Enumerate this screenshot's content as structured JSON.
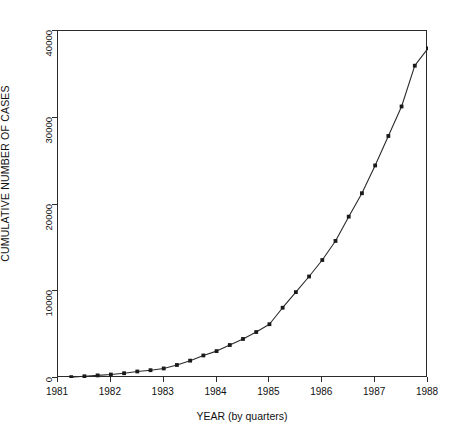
{
  "figure": {
    "background": "#ffffff",
    "ink": "#2b2b2b"
  },
  "axis_titles": {
    "x": "YEAR (by quarters)",
    "y": "CUMULATIVE NUMBER OF CASES"
  },
  "y_ticks": [
    {
      "value": 0,
      "label": "0"
    },
    {
      "value": 10000,
      "label": "10000"
    },
    {
      "value": 20000,
      "label": "20000"
    },
    {
      "value": 30000,
      "label": "30000"
    },
    {
      "value": 40000,
      "label": "40000"
    }
  ],
  "x_ticks": [
    {
      "value": 1981,
      "label": "1981"
    },
    {
      "value": 1982,
      "label": "1982"
    },
    {
      "value": 1983,
      "label": "1983"
    },
    {
      "value": 1984,
      "label": "1984"
    },
    {
      "value": 1985,
      "label": "1985"
    },
    {
      "value": 1986,
      "label": "1986"
    },
    {
      "value": 1987,
      "label": "1987"
    },
    {
      "value": 1988,
      "label": "1988"
    }
  ],
  "chart_data": {
    "type": "line",
    "title": "",
    "subtitle": "",
    "xlabel": "YEAR (by quarters)",
    "ylabel": "CUMULATIVE NUMBER OF CASES",
    "xlim": [
      1981.0,
      1988.0
    ],
    "ylim": [
      0,
      40000
    ],
    "x_tick_values": [
      1981,
      1982,
      1983,
      1984,
      1985,
      1986,
      1987,
      1988
    ],
    "y_tick_values": [
      0,
      10000,
      20000,
      30000,
      40000
    ],
    "grid": false,
    "legend": null,
    "legend_position": "none",
    "marker": "filled-square",
    "line_color": "#2b2b2b",
    "marker_color": "#1a1a1a",
    "x": [
      1981.25,
      1981.5,
      1981.75,
      1982.0,
      1982.25,
      1982.5,
      1982.75,
      1983.0,
      1983.25,
      1983.5,
      1983.75,
      1984.0,
      1984.25,
      1984.5,
      1984.75,
      1985.0,
      1985.25,
      1985.5,
      1985.75,
      1986.0,
      1986.25,
      1986.5,
      1986.75,
      1987.0,
      1987.25,
      1987.5,
      1987.75,
      1988.0
    ],
    "x_tick_labels_quarterly": [
      "1981 Q2",
      "1981 Q3",
      "1981 Q4",
      "1982 Q1",
      "1982 Q2",
      "1982 Q3",
      "1982 Q4",
      "1983 Q1",
      "1983 Q2",
      "1983 Q3",
      "1983 Q4",
      "1984 Q1",
      "1984 Q2",
      "1984 Q3",
      "1984 Q4",
      "1985 Q1",
      "1985 Q2",
      "1985 Q3",
      "1985 Q4",
      "1986 Q1",
      "1986 Q2",
      "1986 Q3",
      "1986 Q4",
      "1987 Q1",
      "1987 Q2",
      "1987 Q3",
      "1987 Q4",
      "1988 Q1"
    ],
    "series": [
      {
        "name": "Cumulative number of cases",
        "values": [
          100,
          200,
          300,
          400,
          550,
          750,
          900,
          1100,
          1500,
          2000,
          2600,
          3100,
          3800,
          4500,
          5300,
          6200,
          8100,
          9900,
          11700,
          13600,
          15800,
          18600,
          21300,
          24500,
          27900,
          31300,
          36000,
          38000
        ]
      }
    ],
    "ylabel_units": "cases"
  }
}
